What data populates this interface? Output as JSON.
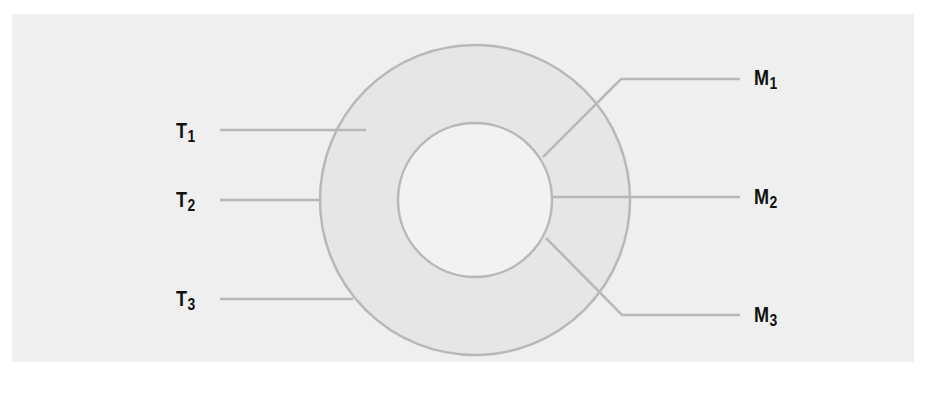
{
  "diagram": {
    "type": "induction-motor-rotor-connection",
    "colors": {
      "panel_bg": "#efefef",
      "ring_fill": "#e6e6e6",
      "inner_fill": "#f2f2f2",
      "stroke": "#b8b8b8",
      "label": "#111111"
    },
    "rings": {
      "center": [
        475,
        200
      ],
      "outer_radius": 155,
      "inner_radius": 77
    },
    "left_terminals": [
      {
        "letter": "T",
        "index": "1",
        "y": 130
      },
      {
        "letter": "T",
        "index": "2",
        "y": 200
      },
      {
        "letter": "T",
        "index": "3",
        "y": 298
      }
    ],
    "right_terminals": [
      {
        "letter": "M",
        "index": "1",
        "y": 78
      },
      {
        "letter": "M",
        "index": "2",
        "y": 197
      },
      {
        "letter": "M",
        "index": "3",
        "y": 315
      }
    ]
  },
  "caption": {
    "text": "",
    "clipped": true
  }
}
